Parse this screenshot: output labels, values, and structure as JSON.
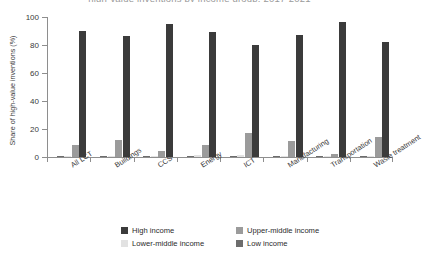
{
  "title": {
    "text": "high-value inventions by income group, 2017-2021",
    "clipped": true
  },
  "legend": {
    "position": "bottom",
    "rows": [
      [
        {
          "label": "High income",
          "color": "#3b3b3b"
        },
        {
          "label": "Upper-middle income",
          "color": "#9b9b9b"
        }
      ],
      [
        {
          "label": "Lower-middle income",
          "color": "#e2e2e2"
        },
        {
          "label": "Low income",
          "color": "#6d6d6d"
        }
      ]
    ]
  },
  "chart_data": {
    "type": "bar",
    "title": "high-value inventions by income group, 2017-2021",
    "xlabel": "",
    "ylabel": "Share of high-value inventions (%)",
    "ylim": [
      0,
      100
    ],
    "yticks": [
      0,
      20,
      40,
      60,
      80,
      100
    ],
    "ytick_labels": [
      "0",
      "20",
      "40",
      "60",
      "80",
      "100"
    ],
    "grid": false,
    "legend_position": "bottom",
    "categories": [
      "All LCT",
      "Buildings",
      "CCS",
      "Energy",
      "ICT",
      "Manufacturing",
      "Transportation",
      "Waste treatment"
    ],
    "series": [
      {
        "name": "High income",
        "color": "#3b3b3b",
        "values": [
          90.3,
          86.6,
          94.8,
          89.5,
          80.0,
          86.8,
          96.3,
          82.5
        ]
      },
      {
        "name": "Upper-middle income",
        "color": "#9b9b9b",
        "values": [
          8.8,
          12.3,
          4.0,
          8.6,
          17.4,
          11.3,
          2.2,
          14.6
        ]
      },
      {
        "name": "Lower-middle income",
        "color": "#e2e2e2",
        "values": [
          0.6,
          0.8,
          0.5,
          1.1,
          1.3,
          0.8,
          0.7,
          0.9
        ]
      },
      {
        "name": "Low income",
        "color": "#6d6d6d",
        "values": [
          0.3,
          0.3,
          0.2,
          0.4,
          0.4,
          0.3,
          0.2,
          0.3
        ]
      }
    ],
    "bar_order_in_group": [
      "Low income",
      "Lower-middle income",
      "Upper-middle income",
      "High income"
    ]
  },
  "axis": {
    "line_color": "#8e8e8e"
  }
}
